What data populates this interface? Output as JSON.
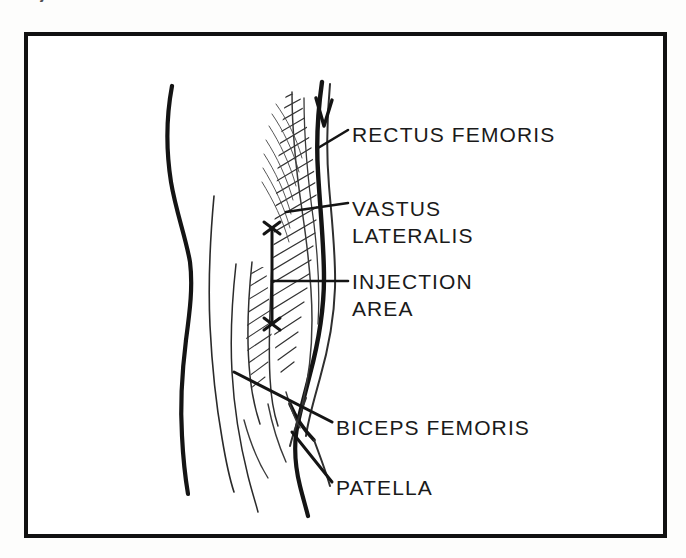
{
  "figure": {
    "caption_partial": "Injection sites",
    "border_color": "#111111",
    "ink_color": "#1a1a1a",
    "background_color": "#ffffff"
  },
  "labels": [
    {
      "id": "rectus-femoris",
      "lines": [
        "RECTUS FEMORIS"
      ],
      "x": 352,
      "y": 121
    },
    {
      "id": "vastus-lateralis",
      "lines": [
        "VASTUS",
        "LATERALIS"
      ],
      "x": 352,
      "y": 195
    },
    {
      "id": "injection-area",
      "lines": [
        "INJECTION",
        "AREA"
      ],
      "x": 352,
      "y": 268
    },
    {
      "id": "biceps-femoris",
      "lines": [
        "BICEPS FEMORIS"
      ],
      "x": 336,
      "y": 414
    },
    {
      "id": "patella",
      "lines": [
        "PATELLA"
      ],
      "x": 336,
      "y": 474
    }
  ],
  "markers": {
    "injection_top_mark": "x",
    "injection_bottom_mark": "x",
    "bracket_top_y": 228,
    "bracket_bottom_y": 326,
    "bracket_x": 272
  },
  "anatomy": {
    "view": "lateral right thigh and knee",
    "structures": [
      "rectus femoris",
      "vastus lateralis",
      "biceps femoris",
      "patella",
      "injection area"
    ]
  }
}
